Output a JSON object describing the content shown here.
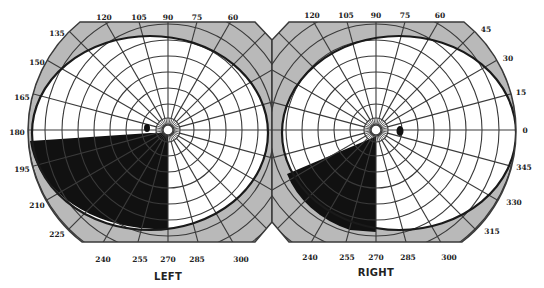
{
  "figure": {
    "type": "visual-field-perimetry-chart"
  },
  "colors": {
    "background": "#ffffff",
    "periphery_shade": "#b9b9b9",
    "grid_line": "#3a3a3a",
    "isopter": "#1a1a1a",
    "scotoma": "#111111",
    "label": "#222222"
  },
  "grid": {
    "radial_spokes_deg_step": 15,
    "concentric_rings_deg_step": 10,
    "max_eccentricity_deg": 90
  },
  "left_eye": {
    "title": "LEFT",
    "center": [
      168,
      130
    ],
    "angle_labels": [
      {
        "text": "120",
        "x": 104,
        "y": 17
      },
      {
        "text": "105",
        "x": 139,
        "y": 17
      },
      {
        "text": "90",
        "x": 168,
        "y": 17
      },
      {
        "text": "75",
        "x": 197,
        "y": 17
      },
      {
        "text": "60",
        "x": 233,
        "y": 17
      },
      {
        "text": "135",
        "x": 57,
        "y": 33
      },
      {
        "text": "150",
        "x": 37,
        "y": 62
      },
      {
        "text": "165",
        "x": 22,
        "y": 97
      },
      {
        "text": "180",
        "x": 17,
        "y": 132
      },
      {
        "text": "195",
        "x": 22,
        "y": 169
      },
      {
        "text": "210",
        "x": 37,
        "y": 205
      },
      {
        "text": "225",
        "x": 57,
        "y": 234
      },
      {
        "text": "240",
        "x": 103,
        "y": 259
      },
      {
        "text": "255",
        "x": 140,
        "y": 259
      },
      {
        "text": "270",
        "x": 168,
        "y": 259
      },
      {
        "text": "285",
        "x": 197,
        "y": 259
      },
      {
        "text": "300",
        "x": 241,
        "y": 259
      }
    ],
    "isopter": {
      "cx": 150,
      "cy": 133,
      "rx": 118,
      "ry": 97
    },
    "scotomas": [
      {
        "kind": "inferior-temporal-quadrant",
        "label": "dense scotoma"
      },
      {
        "kind": "blind-spot",
        "x": 147,
        "y": 128,
        "rx": 3,
        "ry": 4
      }
    ]
  },
  "right_eye": {
    "title": "RIGHT",
    "center": [
      376,
      130
    ],
    "angle_labels": [
      {
        "text": "120",
        "x": 312,
        "y": 15
      },
      {
        "text": "105",
        "x": 346,
        "y": 15
      },
      {
        "text": "90",
        "x": 376,
        "y": 15
      },
      {
        "text": "75",
        "x": 405,
        "y": 15
      },
      {
        "text": "60",
        "x": 440,
        "y": 15
      },
      {
        "text": "45",
        "x": 486,
        "y": 29
      },
      {
        "text": "30",
        "x": 508,
        "y": 58
      },
      {
        "text": "15",
        "x": 521,
        "y": 92
      },
      {
        "text": "0",
        "x": 525,
        "y": 130
      },
      {
        "text": "345",
        "x": 524,
        "y": 167
      },
      {
        "text": "330",
        "x": 514,
        "y": 202
      },
      {
        "text": "315",
        "x": 492,
        "y": 231
      },
      {
        "text": "240",
        "x": 310,
        "y": 257
      },
      {
        "text": "255",
        "x": 347,
        "y": 257
      },
      {
        "text": "270",
        "x": 376,
        "y": 257
      },
      {
        "text": "285",
        "x": 408,
        "y": 257
      },
      {
        "text": "300",
        "x": 449,
        "y": 257
      }
    ],
    "isopter": {
      "cx": 399,
      "cy": 133,
      "rx": 117,
      "ry": 97
    },
    "scotomas": [
      {
        "kind": "inferior-nasal-wedge",
        "label": "dense scotoma"
      },
      {
        "kind": "blind-spot",
        "x": 400,
        "y": 131,
        "rx": 3.5,
        "ry": 5
      }
    ]
  }
}
